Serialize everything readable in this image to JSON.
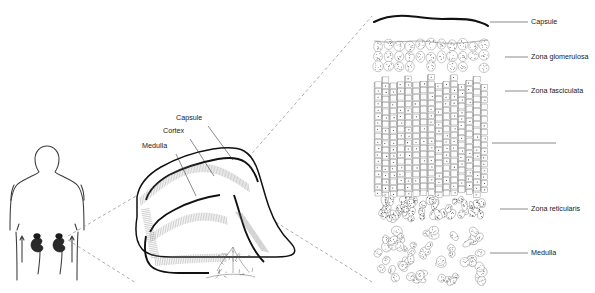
{
  "figure": {
    "background": "#ffffff",
    "ink": "#1a1a1a"
  },
  "panels": {
    "body": {
      "name": "human torso with kidneys and adrenal glands",
      "organs": [
        "left-kidney",
        "right-kidney",
        "left-adrenal-gland",
        "right-adrenal-gland"
      ]
    },
    "gland": {
      "name": "adrenal gland cross-section",
      "labels": [
        {
          "id": "capsule",
          "text": "Capsule",
          "x": 176,
          "y": 118,
          "lx": 208,
          "ly": 126,
          "ex": 233,
          "ey": 160
        },
        {
          "id": "cortex",
          "text": "Cortex",
          "x": 163,
          "y": 131,
          "lx": 190,
          "ly": 139,
          "ex": 214,
          "ey": 176
        },
        {
          "id": "medulla",
          "text": "Medulla",
          "x": 142,
          "y": 146,
          "lx": 176,
          "ly": 154,
          "ex": 196,
          "ey": 196
        }
      ]
    },
    "histology": {
      "name": "adrenal cortex histology magnification",
      "zones": [
        {
          "id": "capsule",
          "label": "Capsule",
          "y": 22,
          "leader_x1": 490,
          "leader_x2": 528,
          "text_x": 531
        },
        {
          "id": "zona-glomerulosa",
          "label": "Zona glomerulosa",
          "y": 57,
          "leader_x1": 505,
          "leader_x2": 528,
          "text_x": 531
        },
        {
          "id": "zona-fasciculata",
          "label": "Zona fasciculata",
          "y": 91,
          "leader_x1": 505,
          "leader_x2": 528,
          "text_x": 531
        },
        {
          "id": "zona-fasciculata-extent",
          "label": "",
          "y": 143,
          "leader_x1": 492,
          "leader_x2": 556,
          "text_x": 559
        },
        {
          "id": "zona-reticularis",
          "label": "Zona reticularis",
          "y": 209,
          "leader_x1": 500,
          "leader_x2": 528,
          "text_x": 531
        },
        {
          "id": "medulla",
          "label": "Medulla",
          "y": 253,
          "leader_x1": 490,
          "leader_x2": 528,
          "text_x": 531
        }
      ]
    }
  },
  "connectors": [
    {
      "id": "magnify-upper",
      "from": "gland-apex",
      "to": "histology-top-left"
    },
    {
      "id": "magnify-lower",
      "from": "gland-base",
      "to": "histology-bottom-left"
    },
    {
      "id": "body-upper",
      "from": "body-adrenal",
      "to": "gland-upper-left"
    },
    {
      "id": "body-lower",
      "from": "body-adrenal",
      "to": "gland-lower-left"
    }
  ]
}
